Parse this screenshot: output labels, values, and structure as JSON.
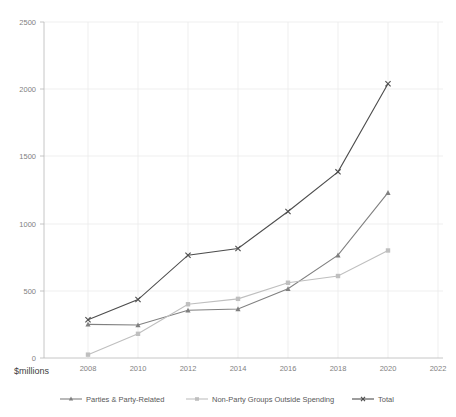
{
  "chart_data": {
    "type": "line",
    "title": "",
    "xlabel": "$millions",
    "ylabel": "",
    "ylim": [
      0,
      2500
    ],
    "xlim": [
      2007,
      2022.6
    ],
    "grid": true,
    "legend_position": "bottom",
    "x": [
      2008,
      2010,
      2012,
      2014,
      2016,
      2018,
      2020
    ],
    "xticks": [
      "2008",
      "2010",
      "2012",
      "2014",
      "2016",
      "2018",
      "2020",
      "2022"
    ],
    "xtick_values": [
      2008,
      2010,
      2012,
      2014,
      2016,
      2018,
      2020,
      2022
    ],
    "yticks": [
      "0",
      "500",
      "1000",
      "1500",
      "2000",
      "2500"
    ],
    "ytick_values": [
      0,
      500,
      1000,
      1500,
      2000,
      2500
    ],
    "series": [
      {
        "name": "Parties & Party-Related",
        "color": "#808080",
        "marker": "triangle",
        "values": [
          250,
          245,
          355,
          365,
          515,
          765,
          1230
        ]
      },
      {
        "name": "Non-Party Groups Outside Spending",
        "color": "#bfbfbf",
        "marker": "square",
        "values": [
          25,
          180,
          400,
          440,
          560,
          610,
          800
        ]
      },
      {
        "name": "Total",
        "color": "#4d4d4d",
        "marker": "x",
        "values": [
          285,
          435,
          765,
          815,
          1090,
          1385,
          2040
        ]
      }
    ]
  },
  "axis": {
    "y_label_0": "0",
    "y_label_500": "500",
    "y_label_1000": "1000",
    "y_label_1500": "1500",
    "y_label_2000": "2000",
    "y_label_2500": "2500",
    "x_label_2008": "2008",
    "x_label_2010": "2010",
    "x_label_2012": "2012",
    "x_label_2014": "2014",
    "x_label_2016": "2016",
    "x_label_2018": "2018",
    "x_label_2020": "2020",
    "x_label_2022": "2022",
    "units_caption": "$millions"
  },
  "legend": {
    "item_1": "Parties & Party-Related",
    "item_2": "Non-Party Groups Outside Spending",
    "item_3": "Total"
  }
}
